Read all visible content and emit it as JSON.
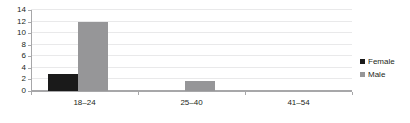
{
  "chart_data": {
    "type": "bar",
    "title": "",
    "subtitle": "",
    "xlabel": "",
    "ylabel": "",
    "categories": [
      "18–24",
      "25–40",
      "41–54"
    ],
    "series": [
      {
        "name": "Female",
        "color": "#1a1a1a",
        "values": [
          3,
          0,
          0
        ]
      },
      {
        "name": "Male",
        "color": "#969698",
        "values": [
          12,
          1.8,
          0
        ]
      }
    ],
    "ylim": [
      0,
      14
    ],
    "yticks": [
      0,
      2,
      4,
      6,
      8,
      10,
      12,
      14
    ],
    "ytick_labels": [
      "0",
      "2",
      "4",
      "6",
      "8",
      "10",
      "12",
      "14"
    ],
    "grid": true,
    "grid_axis": "y",
    "grid_color": "#e9e9ea",
    "axis_color": "#a7a7a9",
    "legend": {
      "position": "right",
      "entries": [
        {
          "label": "Female",
          "color": "#1a1a1a",
          "swatch": "square-swatch"
        },
        {
          "label": "Male",
          "color": "#969698",
          "swatch": "square-swatch"
        }
      ]
    },
    "background": "#ffffff"
  }
}
